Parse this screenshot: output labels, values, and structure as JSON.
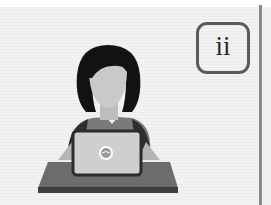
{
  "illustration": {
    "subject": "person-at-laptop",
    "label": "ii",
    "colors": {
      "background": "#efefef",
      "hair": "#121212",
      "face": "#c9c9c9",
      "shirt": "#7a7a7a",
      "laptop_body": "#cfcfcf",
      "laptop_frame": "#2b2b2b",
      "desk_top": "#6c6c6c",
      "desk_edge": "#3e3e3e",
      "label_border": "#5a5a5a",
      "divider": "#8a8a8a"
    }
  }
}
